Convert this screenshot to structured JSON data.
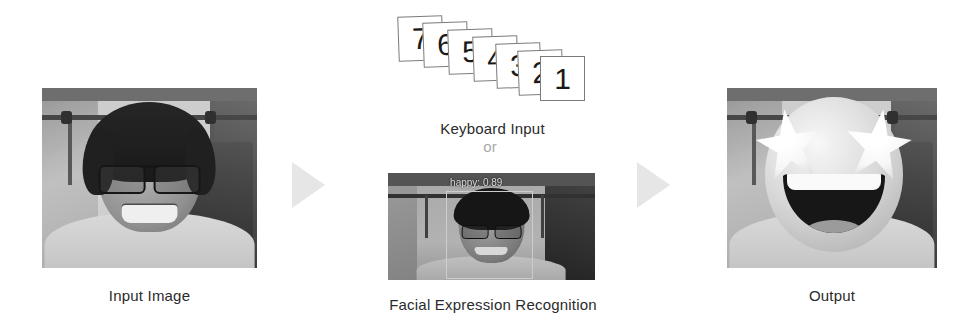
{
  "figure": {
    "background_color": "#ffffff",
    "text_color": "#2b2b2b",
    "muted_text_color": "#a9a9a9",
    "arrow_color": "#e6e6e6"
  },
  "stages": {
    "input": {
      "caption": "Input Image",
      "media_type": "photograph",
      "description": "Grayscale photo of a smiling person wearing glasses"
    },
    "keyboard": {
      "caption": "Keyboard Input",
      "cards": [
        "7",
        "6",
        "5",
        "4",
        "3",
        "2",
        "1"
      ]
    },
    "connector": {
      "or_label": "or"
    },
    "fer": {
      "caption": "Facial Expression Recognition",
      "detection_label": "happy: 0.89",
      "emotion": "happy",
      "confidence": "0.89",
      "media_type": "webcam-frame",
      "description": "Webcam frame with a face bounding box and emotion label"
    },
    "output": {
      "caption": "Output",
      "media_type": "photograph",
      "description": "Original photo with a star-struck emoji replacing the face"
    }
  },
  "arrows": {
    "first_label": "arrow-right",
    "second_label": "arrow-right"
  }
}
